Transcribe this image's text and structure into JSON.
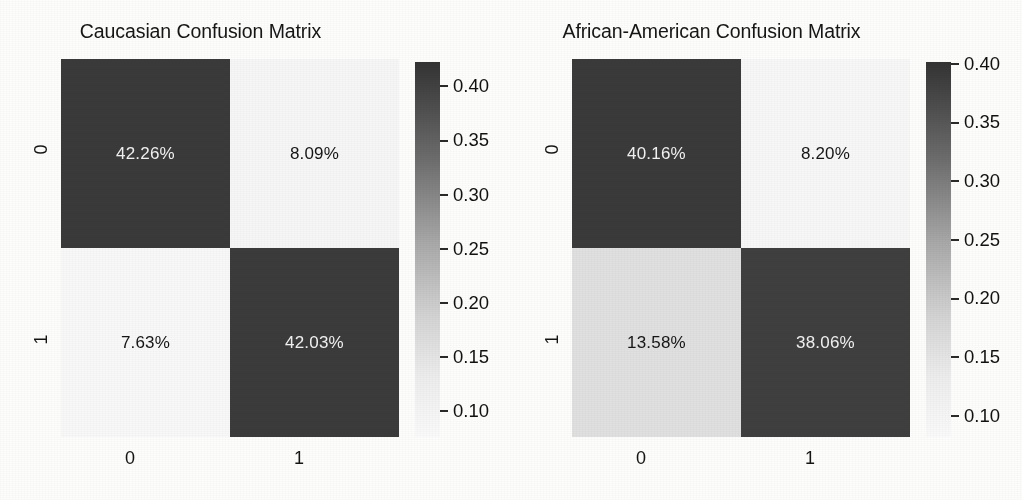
{
  "figure": {
    "background_color": "#fdfdfb",
    "text_color": "#161616"
  },
  "chart_data": [
    {
      "type": "heatmap",
      "title": "Caucasian Confusion Matrix",
      "xlabel": "",
      "ylabel": "",
      "x_tick_labels": [
        "0",
        "1"
      ],
      "y_tick_labels": [
        "0",
        "1"
      ],
      "rows": [
        {
          "row_label": "0",
          "cells": [
            {
              "label": "42.26%",
              "value": 0.4226,
              "color": "#3a3a3a",
              "text_color": "#f2f2f2"
            },
            {
              "label": "8.09%",
              "value": 0.0809,
              "color": "#f6f6f6",
              "text_color": "#151515"
            }
          ]
        },
        {
          "row_label": "1",
          "cells": [
            {
              "label": "7.63%",
              "value": 0.0763,
              "color": "#f8f8f8",
              "text_color": "#151515"
            },
            {
              "label": "42.03%",
              "value": 0.4203,
              "color": "#3b3b3b",
              "text_color": "#f2f2f2"
            }
          ]
        }
      ],
      "colorbar": {
        "ticks": [
          0.4,
          0.35,
          0.3,
          0.25,
          0.2,
          0.15,
          0.1
        ],
        "tick_labels": [
          "0.40",
          "0.35",
          "0.30",
          "0.25",
          "0.20",
          "0.15",
          "0.10"
        ],
        "vmin": 0.0763,
        "vmax": 0.4226,
        "cmap": "grayscale-reversed",
        "high_color": "#333333",
        "low_color": "#fafafa",
        "position": "right"
      }
    },
    {
      "type": "heatmap",
      "title": "African-American Confusion Matrix",
      "xlabel": "",
      "ylabel": "",
      "x_tick_labels": [
        "0",
        "1"
      ],
      "y_tick_labels": [
        "0",
        "1"
      ],
      "rows": [
        {
          "row_label": "0",
          "cells": [
            {
              "label": "40.16%",
              "value": 0.4016,
              "color": "#3a3a3a",
              "text_color": "#f2f2f2"
            },
            {
              "label": "8.20%",
              "value": 0.082,
              "color": "#f7f7f7",
              "text_color": "#151515"
            }
          ]
        },
        {
          "row_label": "1",
          "cells": [
            {
              "label": "13.58%",
              "value": 0.1358,
              "color": "#e0e0e0",
              "text_color": "#151515"
            },
            {
              "label": "38.06%",
              "value": 0.3806,
              "color": "#3f3f3f",
              "text_color": "#f2f2f2"
            }
          ]
        }
      ],
      "colorbar": {
        "ticks": [
          0.4,
          0.35,
          0.3,
          0.25,
          0.2,
          0.15,
          0.1
        ],
        "tick_labels": [
          "0.40",
          "0.35",
          "0.30",
          "0.25",
          "0.20",
          "0.15",
          "0.10"
        ],
        "vmin": 0.082,
        "vmax": 0.4016,
        "cmap": "grayscale-reversed",
        "high_color": "#333333",
        "low_color": "#fafafa",
        "position": "right"
      }
    }
  ]
}
